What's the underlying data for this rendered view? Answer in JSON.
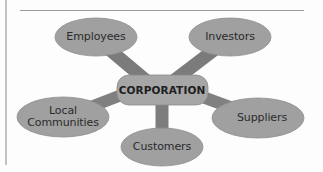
{
  "diagram": {
    "type": "hub-and-spoke stakeholder diagram",
    "center": {
      "label": "CORPORATION"
    },
    "stakeholders": [
      {
        "label": "Employees"
      },
      {
        "label": "Investors"
      },
      {
        "label": "Local Communities",
        "line1": "Local",
        "line2": "Communities"
      },
      {
        "label": "Suppliers"
      },
      {
        "label": "Customers"
      }
    ],
    "colors": {
      "node_fill": "#9e9e9e",
      "node_stroke": "#8a8a8a",
      "connector": "#7d7d7d",
      "center_fill": "#a3a3a3",
      "text": "#2b2b2b",
      "rule": "#9a9a9a"
    }
  }
}
